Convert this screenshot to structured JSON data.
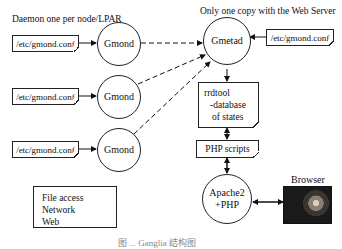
{
  "diagram": {
    "left_heading": "Daemon one per node/LPAR",
    "right_heading": "Only one copy with the Web Server",
    "nodes": {
      "gmond_conf_1": "/etc/gmond.conf",
      "gmond_conf_2": "/etc/gmond.conf",
      "gmond_conf_3": "/etc/gmond.conf",
      "gmetad_conf": "/etc/gmond.conf",
      "gmond_1": "Gmond",
      "gmond_2": "Gmond",
      "gmond_3": "Gmond",
      "gmetad": "Gmetad",
      "rrdtool_line1": "rrdtool",
      "rrdtool_line2": "-database",
      "rrdtool_line3": "of states",
      "php_scripts": "PHP scripts",
      "apache_line1": "Apache2",
      "apache_line2": "+PHP",
      "browser": "Browser"
    },
    "legend": {
      "items": [
        {
          "label": "File access",
          "style": "solid-thin"
        },
        {
          "label": "Network",
          "style": "dashed"
        },
        {
          "label": "Web",
          "style": "solid-thick"
        }
      ]
    },
    "edges": [
      {
        "from": "gmond_conf_1",
        "to": "gmond_1",
        "type": "File access"
      },
      {
        "from": "gmond_conf_2",
        "to": "gmond_2",
        "type": "File access"
      },
      {
        "from": "gmond_conf_3",
        "to": "gmond_3",
        "type": "File access"
      },
      {
        "from": "gmond_1",
        "to": "gmetad",
        "type": "Network"
      },
      {
        "from": "gmond_2",
        "to": "gmetad",
        "type": "Network"
      },
      {
        "from": "gmond_3",
        "to": "gmetad",
        "type": "Network"
      },
      {
        "from": "gmetad_conf",
        "to": "gmetad",
        "type": "File access"
      },
      {
        "from": "gmetad",
        "to": "rrdtool",
        "type": "File access"
      },
      {
        "from": "rrdtool",
        "to": "php_scripts",
        "type": "File access"
      },
      {
        "from": "php_scripts",
        "to": "apache",
        "type": "File access"
      },
      {
        "from": "apache",
        "to": "browser",
        "type": "Web",
        "bidirectional": true
      }
    ],
    "caption": "图 ... Ganglia 结构图"
  }
}
